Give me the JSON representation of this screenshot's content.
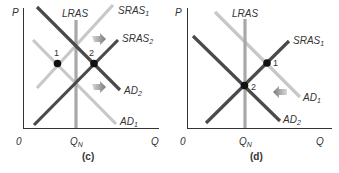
{
  "colors": {
    "dark_line": "#4a4a4a",
    "light_line": "#c8c8c8",
    "lras_line": "#a8a8a8",
    "axis": "#333333",
    "point": "#111111",
    "arrow": "#8a8a8a",
    "text": "#333333"
  },
  "panels": [
    {
      "id": "c",
      "caption": "(c)",
      "axis_y_label": "P",
      "axis_x_label": "Q",
      "origin_label": "0",
      "qn_label": "Q",
      "qn_sub": "N",
      "lras_label": "LRAS",
      "curves": {
        "sras1": {
          "label": "SRAS",
          "sub": "1"
        },
        "sras2": {
          "label": "SRAS",
          "sub": "2"
        },
        "ad1": {
          "label": "AD",
          "sub": "1"
        },
        "ad2": {
          "label": "AD",
          "sub": "2"
        }
      },
      "points": [
        {
          "label": "1"
        },
        {
          "label": "2"
        }
      ],
      "arrows": [
        "sras-shift-right-arrow",
        "ad-shift-right-arrow"
      ]
    },
    {
      "id": "d",
      "caption": "(d)",
      "axis_y_label": "P",
      "axis_x_label": "Q",
      "origin_label": "0",
      "qn_label": "Q",
      "qn_sub": "N",
      "lras_label": "LRAS",
      "curves": {
        "sras1": {
          "label": "SRAS",
          "sub": "1"
        },
        "ad1": {
          "label": "AD",
          "sub": "1"
        },
        "ad2": {
          "label": "AD",
          "sub": "2"
        }
      },
      "points": [
        {
          "label": "1"
        },
        {
          "label": "2"
        }
      ],
      "arrows": [
        "ad-shift-left-arrow"
      ]
    }
  ]
}
